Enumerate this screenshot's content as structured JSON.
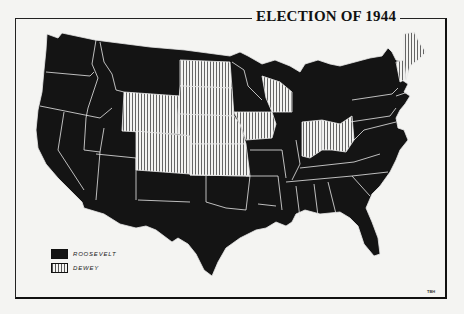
{
  "title": "ELECTION OF 1944",
  "colors": {
    "roosevelt": "#141414",
    "dewey_stripe": "#555555",
    "dewey_bg": "#f4f4f2",
    "border": "#e8e8e8"
  },
  "legend": [
    {
      "label": "ROOSEVELT",
      "pattern": "solid-black"
    },
    {
      "label": "DEWEY",
      "pattern": "vertical-stripes"
    }
  ],
  "credit": "TBH",
  "states": {
    "dewey": [
      "Wyoming",
      "Colorado",
      "North Dakota",
      "South Dakota",
      "Nebraska",
      "Kansas",
      "Iowa",
      "Wisconsin",
      "Indiana",
      "Ohio",
      "Vermont",
      "Maine"
    ],
    "roosevelt": [
      "Washington",
      "Oregon",
      "California",
      "Nevada",
      "Idaho",
      "Montana",
      "Utah",
      "Arizona",
      "New Mexico",
      "Texas",
      "Oklahoma",
      "Minnesota",
      "Missouri",
      "Arkansas",
      "Louisiana",
      "Illinois",
      "Michigan",
      "Kentucky",
      "Tennessee",
      "Mississippi",
      "Alabama",
      "Georgia",
      "Florida",
      "South Carolina",
      "North Carolina",
      "Virginia",
      "West Virginia",
      "Maryland",
      "Delaware",
      "Pennsylvania",
      "New Jersey",
      "New York",
      "Connecticut",
      "Rhode Island",
      "Massachusetts",
      "New Hampshire"
    ]
  }
}
